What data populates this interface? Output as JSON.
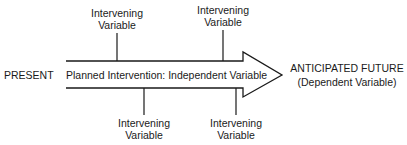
{
  "diagram": {
    "start_label": "PRESENT",
    "arrow_label": "Planned Intervention: Independent Variable",
    "end_label_line1": "ANTICIPATED FUTURE",
    "end_label_line2": "(Dependent Variable)",
    "intervening": [
      {
        "line1": "Intervening",
        "line2": "Variable",
        "position": "top"
      },
      {
        "line1": "Intervening",
        "line2": "Variable",
        "position": "top"
      },
      {
        "line1": "Intervening",
        "line2": "Variable",
        "position": "bottom"
      },
      {
        "line1": "Intervening",
        "line2": "Variable",
        "position": "bottom"
      }
    ]
  }
}
